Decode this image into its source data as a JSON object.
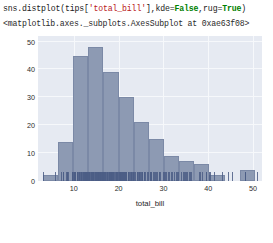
{
  "notebook": {
    "code_line": {
      "segments": [
        {
          "text": "sns.distplot(tips[",
          "kind": "plain"
        },
        {
          "text": "'total_bill'",
          "kind": "string"
        },
        {
          "text": "],kde=",
          "kind": "plain"
        },
        {
          "text": "False",
          "kind": "keyword"
        },
        {
          "text": ",rug=",
          "kind": "plain"
        },
        {
          "text": "True",
          "kind": "keyword"
        },
        {
          "text": ")",
          "kind": "plain"
        }
      ],
      "full_text": "sns.distplot(tips['total_bill'],kde=False,rug=True)"
    },
    "output_text": "<matplotlib.axes._subplots.AxesSubplot at 0xae63f08>"
  },
  "colors": {
    "plot_background": "#e6eaf2",
    "gridline": "#f6f8fb",
    "bar_fill": "#8d9ab3",
    "bar_edge": "#7b89a6",
    "rug": "#4b5d85",
    "tick_text": "#2b2b2b",
    "code_string": "#ba2121",
    "code_keyword": "#008000"
  },
  "chart_data": {
    "type": "bar",
    "title": "",
    "xlabel": "total_bill",
    "ylabel": "",
    "grid": true,
    "legend": null,
    "xlim": [
      2.0,
      52.0
    ],
    "ylim": [
      0,
      52
    ],
    "xticks": [
      10,
      20,
      30,
      40,
      50
    ],
    "yticks": [
      0,
      10,
      20,
      30,
      40,
      50
    ],
    "bin_edges": [
      3.07,
      6.45,
      9.83,
      13.21,
      16.59,
      19.97,
      23.35,
      26.73,
      30.11,
      33.49,
      36.87,
      40.25,
      43.63,
      47.01,
      50.39
    ],
    "categories": [
      "3.1-6.5",
      "6.5-9.8",
      "9.8-13.2",
      "13.2-16.6",
      "16.6-20.0",
      "20.0-23.4",
      "23.4-26.7",
      "26.7-30.1",
      "30.1-33.5",
      "33.5-36.9",
      "36.9-40.3",
      "40.3-43.6",
      "43.6-47.0",
      "47.0-50.4"
    ],
    "values": [
      2,
      14,
      45,
      48,
      39,
      30,
      21,
      15,
      9,
      7,
      6,
      2,
      0,
      4
    ],
    "rug_values": [
      3.1,
      5.7,
      7.2,
      7.5,
      7.6,
      8.3,
      8.5,
      8.5,
      8.8,
      9.5,
      9.6,
      9.6,
      9.9,
      10.0,
      10.1,
      10.3,
      10.3,
      10.3,
      10.6,
      10.6,
      10.6,
      10.7,
      10.8,
      10.8,
      11.0,
      11.2,
      11.2,
      11.4,
      11.6,
      11.6,
      11.7,
      11.9,
      12.0,
      12.0,
      12.2,
      12.3,
      12.4,
      12.5,
      12.5,
      12.6,
      12.7,
      12.7,
      12.8,
      12.9,
      13.0,
      13.0,
      13.1,
      13.2,
      13.3,
      13.4,
      13.4,
      13.4,
      13.4,
      13.5,
      13.8,
      13.9,
      14.0,
      14.1,
      14.2,
      14.3,
      14.3,
      14.5,
      14.7,
      14.8,
      15.0,
      15.0,
      15.1,
      15.2,
      15.3,
      15.4,
      15.4,
      15.5,
      15.6,
      15.7,
      15.8,
      15.8,
      15.9,
      16.0,
      16.0,
      16.2,
      16.3,
      16.3,
      16.4,
      16.5,
      16.6,
      16.7,
      16.8,
      16.9,
      17.0,
      17.1,
      17.3,
      17.3,
      17.5,
      17.6,
      17.8,
      17.8,
      17.9,
      18.0,
      18.0,
      18.2,
      18.2,
      18.3,
      18.4,
      18.4,
      18.5,
      18.6,
      18.7,
      18.8,
      19.0,
      19.1,
      19.3,
      19.4,
      19.5,
      19.6,
      19.7,
      19.8,
      20.0,
      20.1,
      20.2,
      20.3,
      20.4,
      20.5,
      20.5,
      20.7,
      20.8,
      20.9,
      21.0,
      21.1,
      21.2,
      21.4,
      21.5,
      21.6,
      21.7,
      22.0,
      22.1,
      22.2,
      22.4,
      22.5,
      22.7,
      22.8,
      23.0,
      23.1,
      23.3,
      23.5,
      23.7,
      24.0,
      24.1,
      24.3,
      24.5,
      24.6,
      24.7,
      25.0,
      25.2,
      25.3,
      25.6,
      25.7,
      25.9,
      26.4,
      26.6,
      26.9,
      27.0,
      27.2,
      27.3,
      27.7,
      28.0,
      28.2,
      28.4,
      28.6,
      28.9,
      29.0,
      29.3,
      29.8,
      30.1,
      30.4,
      30.5,
      31.0,
      31.3,
      31.7,
      32.0,
      32.4,
      32.7,
      33.0,
      33.3,
      34.0,
      34.3,
      34.6,
      34.8,
      35.0,
      35.3,
      35.8,
      36.0,
      36.2,
      38.0,
      38.1,
      38.7,
      39.4,
      39.4,
      40.2,
      40.5,
      41.2,
      43.1,
      44.3,
      45.4,
      48.2,
      48.3,
      48.3,
      48.3,
      50.8
    ]
  }
}
